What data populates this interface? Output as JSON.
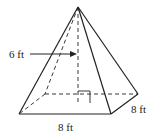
{
  "figure": {
    "type": "square pyramid",
    "height_label": "6 ft",
    "base_front_label": "8 ft",
    "base_side_label": "8 ft",
    "colors": {
      "stroke": "#222222",
      "background": "#ffffff"
    }
  }
}
